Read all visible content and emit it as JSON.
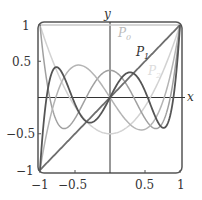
{
  "chart_data": {
    "type": "line",
    "title": "",
    "xlabel": "x",
    "ylabel": "y",
    "xlim": [
      -1,
      1
    ],
    "ylim": [
      -1,
      1
    ],
    "xticks": [
      "-1",
      "-0.5",
      "0.5",
      "1"
    ],
    "yticks": [
      "1",
      "0.5",
      "-0.5",
      "-1"
    ],
    "grid": false,
    "series": [
      {
        "name": "P0",
        "label": "P_0",
        "expression": "1",
        "color": "#c8c8c8"
      },
      {
        "name": "P1",
        "label": "P_1",
        "expression": "x",
        "color": "#6e6e6e"
      },
      {
        "name": "P2",
        "label": "P_2",
        "expression": "(3x^2-1)/2",
        "color": "#d2d2d2"
      },
      {
        "name": "P3",
        "expression": "(5x^3-3x)/2",
        "color": "#b4b4b4"
      },
      {
        "name": "P4",
        "expression": "(35x^4-30x^2+3)/8",
        "color": "#a0a0a0"
      },
      {
        "name": "P5",
        "expression": "(63x^5-70x^3+15x)/8",
        "color": "#555555"
      }
    ],
    "annotations": [
      "P_0",
      "P_1",
      "P_2"
    ]
  },
  "labels": {
    "x": "x",
    "y": "y",
    "p0": "P",
    "p0sub": "0",
    "p1": "P",
    "p1sub": "1",
    "p2": "P",
    "p2sub": "2"
  },
  "ticks": {
    "x": [
      "−1",
      "−0.5",
      "0.5",
      "1"
    ],
    "y": [
      "1",
      "0.5",
      "−0.5",
      "−1"
    ]
  }
}
